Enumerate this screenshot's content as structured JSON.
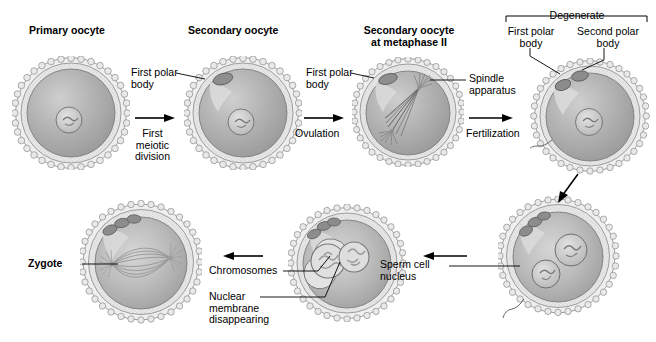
{
  "figure": {
    "title_semantic": "oogenesis-and-fertilization-diagram",
    "background_color": "#ffffff",
    "ink_color": "#000000",
    "cell_fill": "#b4b4b4",
    "cytoplasm_light": "#d8d8d8",
    "zona_color": "#e8e8e8"
  },
  "labels": {
    "primary_oocyte": "Primary oocyte",
    "secondary_oocyte": "Secondary oocyte",
    "secondary_oocyte_metaphase": "Secondary oocyte\nat metaphase II",
    "first_polar_body_1": "First polar\nbody",
    "first_polar_body_2": "First polar\nbody",
    "spindle_apparatus": "Spindle\napparatus",
    "degenerate": "Degenerate",
    "first_polar_body_3": "First polar\nbody",
    "second_polar_body": "Second polar\nbody",
    "first_meiotic_division": "First\nmeiotic\ndivision",
    "ovulation": "Ovulation",
    "fertilization": "Fertilization",
    "sperm_cell_nucleus": "Sperm cell\nnucleus",
    "chromosomes": "Chromosomes",
    "nuclear_membrane": "Nuclear\nmembrane\ndisappearing",
    "zygote": "Zygote"
  },
  "stages": [
    {
      "id": "primary-oocyte",
      "label": "Primary oocyte",
      "row": "top",
      "features": [
        "granulosa-layer",
        "zona-pellucida",
        "nucleus"
      ]
    },
    {
      "id": "secondary-oocyte",
      "label": "Secondary oocyte",
      "row": "top",
      "features": [
        "granulosa-layer",
        "zona-pellucida",
        "nucleus",
        "first-polar-body"
      ]
    },
    {
      "id": "metaphase-ii",
      "label": "Secondary oocyte at metaphase II",
      "row": "top",
      "features": [
        "granulosa-layer",
        "zona-pellucida",
        "spindle-apparatus",
        "first-polar-body"
      ]
    },
    {
      "id": "fertilized-ovum",
      "label": "Fertilized ovum",
      "row": "top",
      "features": [
        "granulosa-layer",
        "two-polar-bodies",
        "nucleus",
        "sperm-tail"
      ]
    },
    {
      "id": "two-pronuclei",
      "label": "Two pronuclei",
      "row": "bottom",
      "features": [
        "granulosa-layer",
        "two-pronuclei",
        "polar-bodies",
        "sperm-tail"
      ]
    },
    {
      "id": "pronuclei-fusing",
      "label": "Pronuclei fusing",
      "row": "bottom",
      "features": [
        "granulosa-layer",
        "fusing-pronuclei",
        "polar-bodies"
      ]
    },
    {
      "id": "zygote",
      "label": "Zygote",
      "row": "bottom",
      "features": [
        "granulosa-layer",
        "mitotic-spindle",
        "polar-bodies"
      ]
    }
  ],
  "transitions": [
    {
      "id": "first-meiotic-division",
      "label": "First\nmeiotic\ndivision",
      "direction": "right"
    },
    {
      "id": "ovulation",
      "label": "Ovulation",
      "direction": "right"
    },
    {
      "id": "fertilization",
      "label": "Fertilization",
      "direction": "right"
    },
    {
      "id": "down-right",
      "label": "",
      "direction": "down-left"
    },
    {
      "id": "bottom-1",
      "label": "",
      "direction": "left"
    },
    {
      "id": "bottom-2",
      "label": "",
      "direction": "left"
    }
  ]
}
